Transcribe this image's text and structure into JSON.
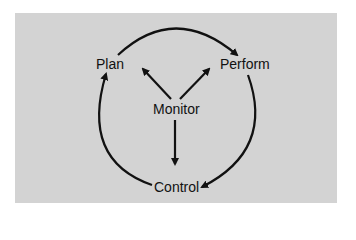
{
  "diagram": {
    "nodes": {
      "plan": "Plan",
      "perform": "Perform",
      "monitor": "Monitor",
      "control": "Control"
    },
    "edges": [
      {
        "from": "Plan",
        "to": "Perform",
        "type": "cycle-arc"
      },
      {
        "from": "Perform",
        "to": "Control",
        "type": "cycle-arc"
      },
      {
        "from": "Control",
        "to": "Plan",
        "type": "cycle-arc"
      },
      {
        "from": "Monitor",
        "to": "Plan",
        "type": "straight"
      },
      {
        "from": "Monitor",
        "to": "Perform",
        "type": "straight"
      },
      {
        "from": "Monitor",
        "to": "Control",
        "type": "straight"
      }
    ],
    "colors": {
      "panel": "#d3d3d3",
      "stroke": "#111111"
    }
  }
}
